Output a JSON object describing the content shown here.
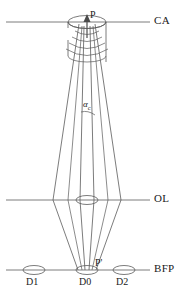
{
  "figure": {
    "type": "optical-ray-diagram",
    "background_color": "#ffffff",
    "line_color": "#5a5a5a",
    "text_color": "#1a1a1a",
    "width": 184,
    "height": 301
  },
  "planes": [
    {
      "id": "ca",
      "label": "CA",
      "description": "condenser aperture plane",
      "y": 22,
      "x_start": 6,
      "x_end": 150,
      "label_x": 154,
      "label_y": 16
    },
    {
      "id": "ol",
      "label": "OL",
      "description": "objective lens plane",
      "y": 200,
      "x_start": 6,
      "x_end": 150,
      "label_x": 154,
      "label_y": 194
    },
    {
      "id": "bfp",
      "label": "BFP",
      "description": "back focal plane",
      "y": 270,
      "x_start": 6,
      "x_end": 150,
      "label_x": 154,
      "label_y": 264
    }
  ],
  "points": [
    {
      "id": "p",
      "label": "P",
      "description": "specimen point at condenser aperture",
      "x": 87,
      "y": 22,
      "label_x": 89,
      "label_y": 12
    },
    {
      "id": "p-prime",
      "label": "P'",
      "description": "image of P at back focal plane",
      "x": 87,
      "y": 270,
      "label_x": 94,
      "label_y": 259
    }
  ],
  "angle": {
    "id": "alpha-c",
    "symbol": "α",
    "subscript": "c",
    "description": "convergence semi-angle of the illumination cone",
    "label_x": 84,
    "label_y": 106
  },
  "disks": [
    {
      "id": "d1",
      "label": "D1",
      "cx": 34,
      "cy": 270,
      "rx": 11,
      "ry": 4.5,
      "label_x": 26,
      "label_y": 277
    },
    {
      "id": "d0",
      "label": "D0",
      "cx": 87,
      "cy": 270,
      "rx": 11,
      "ry": 4.5,
      "label_x": 79,
      "label_y": 277
    },
    {
      "id": "d2",
      "label": "D2",
      "cx": 124,
      "cy": 270,
      "rx": 11,
      "ry": 4.5,
      "label_x": 116,
      "label_y": 277
    }
  ],
  "apertures": [
    {
      "id": "ca-ellipse-top",
      "cx": 87,
      "cy": 22,
      "rx": 19,
      "ry": 6.5
    },
    {
      "id": "ca-ellipse-bottom",
      "cx": 87,
      "cy": 38,
      "rx": 19,
      "ry": 6.5
    },
    {
      "id": "ol-ellipse",
      "cx": 87,
      "cy": 200,
      "rx": 11,
      "ry": 4.5
    }
  ],
  "beam_arrow": {
    "id": "incident-beam-arrow",
    "x": 87,
    "y_tail": 36,
    "y_head": 16,
    "description": "incident electron beam direction"
  },
  "wavefronts": {
    "id": "spherical-wavefronts",
    "count": 4,
    "description": "spherical wavefronts diverging from P"
  },
  "rays": {
    "description": "illumination cone from P focused by OL to disks on BFP",
    "outer_left": {
      "x_top": 79,
      "x_mid": 53,
      "x_bottom": 78
    },
    "outer_right": {
      "x_top": 95,
      "x_mid": 121,
      "x_bottom": 96
    },
    "inner_left": {
      "x_top": 84,
      "x_mid": 80,
      "x_bottom": 85
    },
    "inner_right": {
      "x_top": 90,
      "x_mid": 94,
      "x_bottom": 89
    }
  }
}
